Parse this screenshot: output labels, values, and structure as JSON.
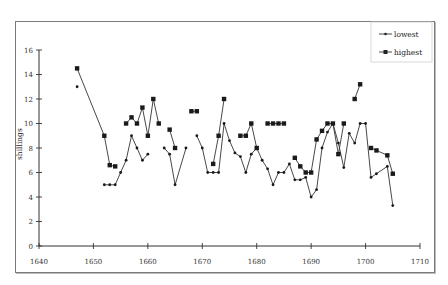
{
  "chart_data": {
    "type": "line",
    "title": "",
    "xlabel": "",
    "ylabel": "shillings",
    "xlim": [
      1640,
      1710
    ],
    "ylim": [
      0,
      16
    ],
    "x_ticks": [
      1640,
      1650,
      1660,
      1670,
      1680,
      1690,
      1700,
      1710
    ],
    "y_ticks": [
      0,
      2,
      4,
      6,
      8,
      10,
      12,
      14,
      16
    ],
    "grid": false,
    "legend_position": "top-right",
    "series": [
      {
        "name": "lowest",
        "marker": "diamond-small",
        "points": [
          [
            1647,
            13
          ],
          [
            1648,
            null
          ],
          [
            1652,
            5
          ],
          [
            1653,
            5
          ],
          [
            1654,
            5
          ],
          [
            1655,
            6
          ],
          [
            1656,
            7
          ],
          [
            1657,
            9
          ],
          [
            1658,
            8
          ],
          [
            1659,
            7
          ],
          [
            1660,
            7.5
          ],
          [
            1661,
            null
          ],
          [
            1663,
            8
          ],
          [
            1664,
            7.5
          ],
          [
            1665,
            5
          ],
          [
            1667,
            8
          ],
          [
            1668,
            null
          ],
          [
            1669,
            9
          ],
          [
            1670,
            8
          ],
          [
            1671,
            6
          ],
          [
            1672,
            6
          ],
          [
            1673,
            6
          ],
          [
            1674,
            10
          ],
          [
            1675,
            8.6
          ],
          [
            1676,
            7.6
          ],
          [
            1677,
            7.3
          ],
          [
            1678,
            6
          ],
          [
            1679,
            7.5
          ],
          [
            1680,
            8
          ],
          [
            1681,
            7
          ],
          [
            1682,
            6.3
          ],
          [
            1683,
            5
          ],
          [
            1684,
            6
          ],
          [
            1685,
            6
          ],
          [
            1686,
            6.7
          ],
          [
            1687,
            5.4
          ],
          [
            1688,
            5.4
          ],
          [
            1689,
            5.6
          ],
          [
            1690,
            4
          ],
          [
            1691,
            4.6
          ],
          [
            1692,
            8
          ],
          [
            1693,
            9.3
          ],
          [
            1694,
            10
          ],
          [
            1695,
            8.4
          ],
          [
            1696,
            6.4
          ],
          [
            1697,
            9.2
          ],
          [
            1698,
            8.4
          ],
          [
            1699,
            10
          ],
          [
            1700,
            10
          ],
          [
            1701,
            5.6
          ],
          [
            1702,
            5.9
          ],
          [
            1704,
            6.5
          ],
          [
            1705,
            3.3
          ]
        ]
      },
      {
        "name": "highest",
        "marker": "square",
        "points": [
          [
            1647,
            14.5
          ],
          [
            1652,
            9
          ],
          [
            1653,
            6.6
          ],
          [
            1654,
            6.5
          ],
          [
            1655,
            null
          ],
          [
            1656,
            10
          ],
          [
            1657,
            10.5
          ],
          [
            1658,
            10
          ],
          [
            1659,
            11.3
          ],
          [
            1660,
            9
          ],
          [
            1661,
            12
          ],
          [
            1662,
            10
          ],
          [
            1663,
            null
          ],
          [
            1664,
            9.5
          ],
          [
            1665,
            8
          ],
          [
            1666,
            null
          ],
          [
            1668,
            11
          ],
          [
            1669,
            11
          ],
          [
            1670,
            null
          ],
          [
            1672,
            6.7
          ],
          [
            1673,
            9
          ],
          [
            1674,
            12
          ],
          [
            1675,
            null
          ],
          [
            1677,
            9
          ],
          [
            1678,
            9
          ],
          [
            1679,
            10
          ],
          [
            1680,
            8
          ],
          [
            1681,
            null
          ],
          [
            1682,
            10
          ],
          [
            1683,
            10
          ],
          [
            1684,
            10
          ],
          [
            1685,
            10
          ],
          [
            1686,
            null
          ],
          [
            1687,
            7.2
          ],
          [
            1688,
            6.5
          ],
          [
            1689,
            6
          ],
          [
            1690,
            6
          ],
          [
            1691,
            8.7
          ],
          [
            1692,
            9.4
          ],
          [
            1693,
            10
          ],
          [
            1694,
            10
          ],
          [
            1695,
            7.5
          ],
          [
            1696,
            10
          ],
          [
            1697,
            null
          ],
          [
            1698,
            12
          ],
          [
            1699,
            13.2
          ],
          [
            1700,
            null
          ],
          [
            1701,
            8
          ],
          [
            1702,
            7.8
          ],
          [
            1704,
            7.4
          ],
          [
            1705,
            5.9
          ]
        ]
      }
    ]
  },
  "legend": {
    "items": [
      {
        "label": "lowest"
      },
      {
        "label": "highest"
      }
    ]
  },
  "axes": {
    "y_title": "shillings"
  },
  "colors": {
    "line": "#333333",
    "frame": "#7a7a7a"
  }
}
